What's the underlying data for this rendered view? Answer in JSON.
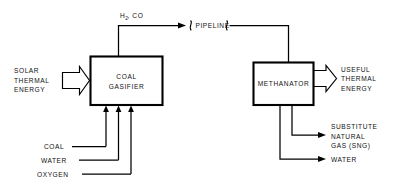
{
  "diagram": {
    "background_color": "#ffffff",
    "line_color": "#000000",
    "units": [
      {
        "id": "coal-gasifier",
        "label_line1": "COAL",
        "label_line2": "GASIFIER"
      },
      {
        "id": "methanator",
        "label_line1": "METHANATOR",
        "label_line2": ""
      }
    ],
    "labels": {
      "solar_thermal_energy": [
        "SOLAR",
        "THERMAL",
        "ENERGY"
      ],
      "useful_thermal_energy": [
        "USEFUL",
        "THERMAL",
        "ENERGY"
      ],
      "syngas_main": "H",
      "syngas_subscript": "2",
      "syngas_rest": ", CO",
      "pipeline": "PIPELINE",
      "coal": "COAL",
      "water_in": "WATER",
      "oxygen": "OXYGEN",
      "sng": [
        "SUBSTITUTE",
        "NATURAL",
        "GAS (SNG)"
      ],
      "water_out": "WATER"
    }
  }
}
